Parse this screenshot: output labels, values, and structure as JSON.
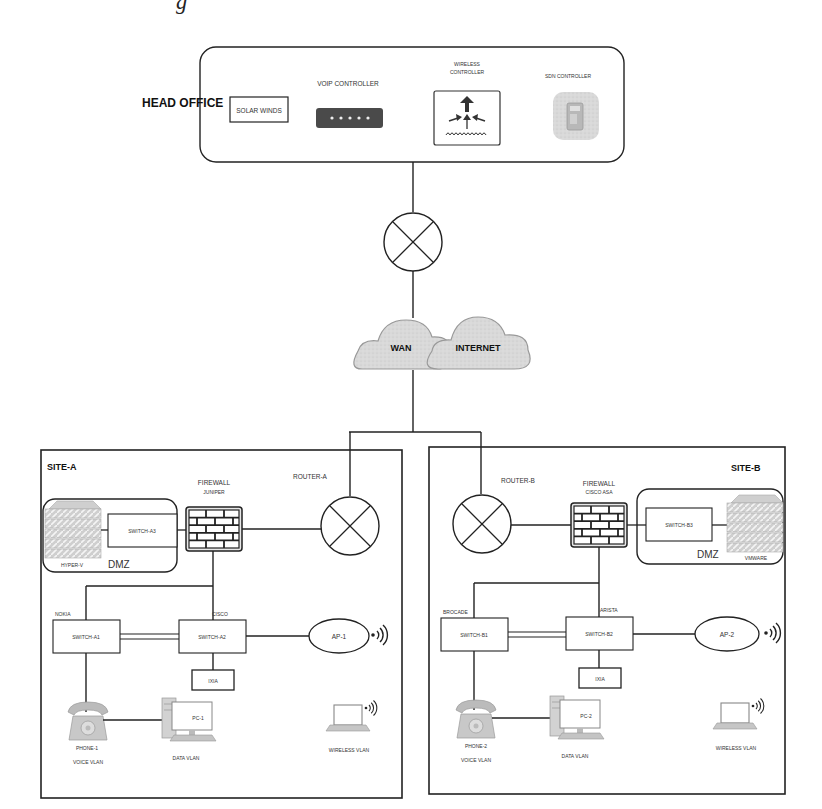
{
  "header_fragment": "g",
  "head_office": {
    "title": "HEAD OFFICE",
    "solar_winds": "SOLAR WINDS",
    "voip_controller": "VOIP CONTROLLER",
    "wireless_controller_line1": "WIRELESS",
    "wireless_controller_line2": "CONTROLLER",
    "sdn_controller": "SDN CONTROLLER"
  },
  "wan": {
    "cloud_wan": "WAN",
    "cloud_internet": "INTERNET"
  },
  "site_a": {
    "title": "SITE-A",
    "router": "ROUTER-A",
    "firewall": "FIREWALL",
    "firewall_vendor": "JUNIPER",
    "dmz_label": "DMZ",
    "dmz_switch": "SWITCH-A3",
    "dmz_server": "HYPER-V",
    "switch1_vendor": "NOKIA",
    "switch1": "SWITCH-A1",
    "switch2_vendor": "CISCO",
    "switch2": "SWITCH-A2",
    "tester": "IXIA",
    "ap": "AP-1",
    "phone": "PHONE-1",
    "voice_vlan": "VOICE VLAN",
    "pc": "PC-1",
    "data_vlan": "DATA VLAN",
    "wireless_vlan": "WIRELESS VLAN"
  },
  "site_b": {
    "title": "SITE-B",
    "router": "ROUTER-B",
    "firewall": "FIREWALL",
    "firewall_vendor": "CISCO ASA",
    "dmz_label": "DMZ",
    "dmz_switch": "SWITCH-B3",
    "dmz_server": "VMWARE",
    "switch1_vendor": "BROCADE",
    "switch1": "SWITCH-B1",
    "switch2_vendor": "ARISTA",
    "switch2": "SWITCH-B2",
    "tester": "IXIA",
    "ap": "AP-2",
    "phone": "PHONE-2",
    "voice_vlan": "VOICE VLAN",
    "pc": "PC-2",
    "data_vlan": "DATA VLAN",
    "wireless_vlan": "WIRELESS VLAN"
  }
}
